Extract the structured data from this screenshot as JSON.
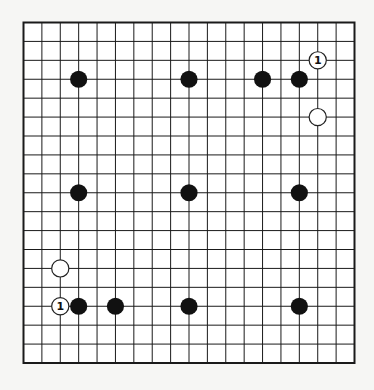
{
  "board": {
    "size": 19,
    "left": 23.5,
    "top": 22.5,
    "right": 354.5,
    "bottom": 363,
    "line_color": "#1a1a1a",
    "board_color": "#ffffff",
    "border_width": 2,
    "line_width": 1
  },
  "stone_style": {
    "radius": 8.6,
    "black_fill": "#111111",
    "white_fill": "#ffffff",
    "white_stroke": "#222222"
  },
  "stones": [
    {
      "color": "black",
      "col": 3,
      "row": 3
    },
    {
      "color": "black",
      "col": 9,
      "row": 3
    },
    {
      "color": "black",
      "col": 13,
      "row": 3
    },
    {
      "color": "black",
      "col": 15,
      "row": 3
    },
    {
      "color": "black",
      "col": 3,
      "row": 9
    },
    {
      "color": "black",
      "col": 9,
      "row": 9
    },
    {
      "color": "black",
      "col": 15,
      "row": 9
    },
    {
      "color": "black",
      "col": 3,
      "row": 15
    },
    {
      "color": "black",
      "col": 5,
      "row": 15
    },
    {
      "color": "black",
      "col": 9,
      "row": 15
    },
    {
      "color": "black",
      "col": 15,
      "row": 15
    },
    {
      "color": "white",
      "col": 16,
      "row": 2,
      "label": "1"
    },
    {
      "color": "white",
      "col": 16,
      "row": 5
    },
    {
      "color": "white",
      "col": 2,
      "row": 13
    },
    {
      "color": "white",
      "col": 2,
      "row": 15,
      "label": "1"
    }
  ]
}
